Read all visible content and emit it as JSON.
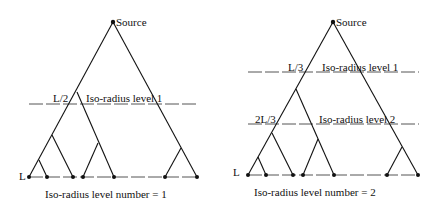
{
  "diagrams": [
    {
      "id": "left",
      "source_label": "Source",
      "bottom_label": "L",
      "level_number_caption": "Iso-radius level number = 1",
      "levels": [
        {
          "fraction_label": "L/2",
          "label": "Iso-radius level 1"
        }
      ]
    },
    {
      "id": "right",
      "source_label": "Source",
      "bottom_label": "L",
      "level_number_caption": "Iso-radius level number = 2",
      "levels": [
        {
          "fraction_label": "L/3",
          "label": "Iso-radius level 1"
        },
        {
          "fraction_label": "2L/3",
          "label": "Iso-radius level 2"
        }
      ]
    }
  ]
}
